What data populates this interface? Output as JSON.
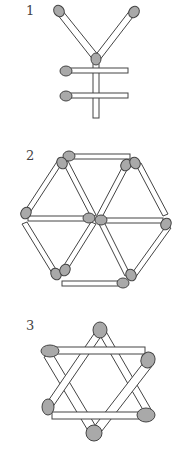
{
  "figures": [
    {
      "label": "1",
      "name": "yen-shape"
    },
    {
      "label": "2",
      "name": "hexagon-of-triangles"
    },
    {
      "label": "3",
      "name": "six-pointed-star"
    }
  ],
  "colors": {
    "head": "#a9a9a9",
    "stick": "#ffffff",
    "outline": "#444444"
  }
}
